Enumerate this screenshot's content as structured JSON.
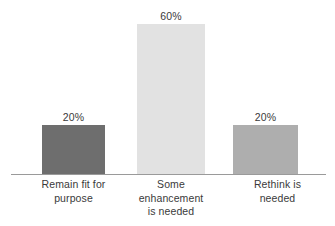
{
  "chart_data": {
    "type": "bar",
    "title": "",
    "xlabel": "",
    "ylabel": "",
    "categories": [
      "Remain fit for purpose",
      "Some enhancement is needed",
      "Rethink is needed"
    ],
    "values": [
      20,
      60,
      20
    ],
    "value_labels": [
      "20%",
      "60%",
      "20%"
    ],
    "ylim": [
      0,
      66
    ],
    "grid": false,
    "legend": "none",
    "axis_line": true,
    "bar_colors": [
      "#6e6e6e",
      "#e2e2e2",
      "#aeaeae"
    ],
    "background_color": "#ffffff",
    "text_color": "#3a3a3a",
    "axis_color": "#9a9a9a",
    "bars": [
      {
        "category_lines": [
          "Remain fit for",
          "purpose"
        ],
        "value": 20,
        "label": "20%",
        "color": "#6e6e6e"
      },
      {
        "category_lines": [
          "Some",
          "enhancement",
          "is needed"
        ],
        "value": 60,
        "label": "60%",
        "color": "#e2e2e2"
      },
      {
        "category_lines": [
          "Rethink is",
          "needed"
        ],
        "value": 20,
        "label": "20%",
        "color": "#aeaeae"
      }
    ]
  }
}
